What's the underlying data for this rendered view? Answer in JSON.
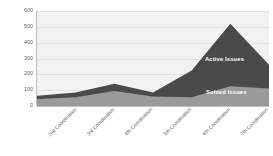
{
  "chart_data": {
    "type": "area",
    "stacked": true,
    "title": "",
    "subtitle": "",
    "xlabel": "",
    "ylabel": "",
    "categories": [
      "2nd Coordination",
      "3rd Coordination",
      "4th Coordination",
      "5th Coordination",
      "6th Coordination",
      "7th Coordination",
      "8th Coordination"
    ],
    "series": [
      {
        "name": "Solved Issues",
        "color": "#9a9a9a",
        "values": [
          45,
          55,
          95,
          60,
          55,
          125,
          110
        ]
      },
      {
        "name": "Active Issues",
        "color": "#4a4a4a",
        "values": [
          20,
          30,
          45,
          25,
          170,
          395,
          150
        ]
      }
    ],
    "totals": [
      65,
      85,
      140,
      85,
      225,
      520,
      260
    ],
    "ylim": [
      0,
      600
    ],
    "yticks": [
      0,
      100,
      200,
      300,
      400,
      500,
      600
    ],
    "ytick_labels": [
      "0",
      "100",
      "200",
      "300",
      "400",
      "500",
      "600"
    ],
    "grid": true,
    "legend_position": "inline-annotations",
    "annotations": [
      {
        "text": "Active Issues",
        "series": "Active Issues"
      },
      {
        "text": "Solved Issues",
        "series": "Solved Issues"
      }
    ],
    "plot_background": "#f2f2f2",
    "gridline_color": "#e2e2e2",
    "axis_color": "#bfbfbf",
    "tick_label_color": "#5a5a5a"
  }
}
